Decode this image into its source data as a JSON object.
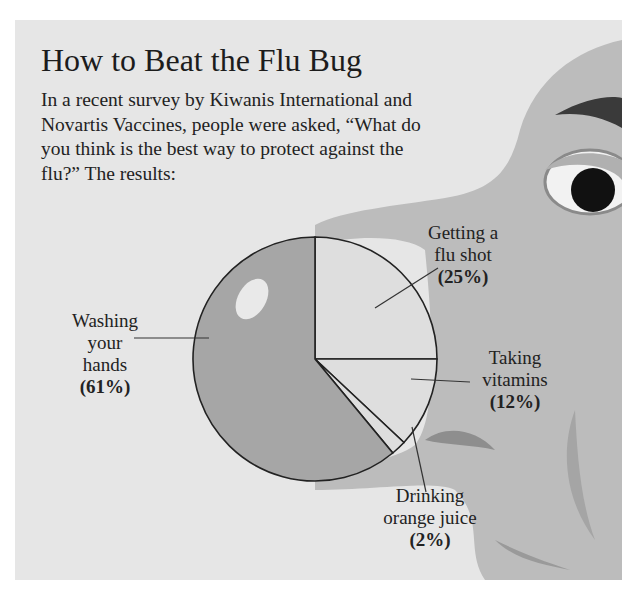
{
  "title": "How to Beat the Flu Bug",
  "intro": "In a recent survey by Kiwanis International and Novartis Vaccines, people were asked, “What do you think is the best way to protect against the flu?” The results:",
  "colors": {
    "background": "#e6e6e6",
    "face": "#bdbdbd",
    "slice_hands": "#a6a6a6",
    "slice_light": "#dedede",
    "outline": "#222222"
  },
  "labels": {
    "flu_shot": {
      "line1": "Getting a",
      "line2": "flu shot",
      "pct": "(25%)"
    },
    "vitamins": {
      "line1": "Taking",
      "line2": "vitamins",
      "pct": "(12%)"
    },
    "juice": {
      "line1": "Drinking",
      "line2": "orange juice",
      "pct": "(2%)"
    },
    "hands": {
      "line1": "Washing",
      "line2": "your",
      "line3": "hands",
      "pct": "(61%)"
    }
  },
  "chart_data": {
    "type": "pie",
    "title": "How to Beat the Flu Bug",
    "subtitle": "In a recent survey by Kiwanis International and Novartis Vaccines, people were asked, “What do you think is the best way to protect against the flu?” The results:",
    "categories": [
      "Getting a flu shot",
      "Taking vitamins",
      "Drinking orange juice",
      "Washing your hands"
    ],
    "values": [
      25,
      12,
      2,
      61
    ],
    "unit": "%",
    "start_angle_deg": 0,
    "direction": "clockwise_from_12_oclock",
    "legend": "none (callout labels)"
  }
}
